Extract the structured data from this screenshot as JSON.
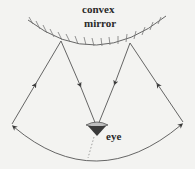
{
  "diagram": {
    "labels": {
      "mirror_line1": "convex",
      "mirror_line2": "mirror",
      "eye": "eye"
    },
    "colors": {
      "background": "#f3f3f1",
      "lines": "#555555",
      "text": "#2a2a2a",
      "eye_fill": "#3a3a3a"
    },
    "elements": [
      {
        "type": "mirror",
        "shape": "convex arc",
        "hatching": "above arc"
      },
      {
        "type": "ray",
        "from": "left field edge",
        "to": "left reflection point",
        "arrow": "toward mirror"
      },
      {
        "type": "ray",
        "from": "left reflection point",
        "to": "eye",
        "arrow": "toward eye"
      },
      {
        "type": "ray",
        "from": "right reflection point",
        "to": "eye",
        "arrow": "toward eye"
      },
      {
        "type": "ray",
        "from": "right field edge",
        "to": "right reflection point",
        "arrow": "toward mirror"
      },
      {
        "type": "arc",
        "description": "field of view",
        "arrows": "both ends"
      },
      {
        "type": "eye",
        "position": "bottom center"
      },
      {
        "type": "dotted-line",
        "from": "eye",
        "direction": "down"
      }
    ]
  }
}
